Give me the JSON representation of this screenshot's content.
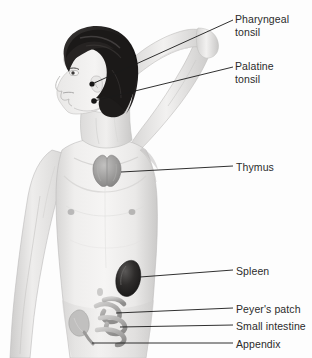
{
  "figure": {
    "view": "anterior-with-head-in-left-profile",
    "pose": "right-arm-raised-hand-behind-head",
    "background_color": "#fdfdfd",
    "line_color": "#1a1a1a",
    "text_color": "#2b2b2b"
  },
  "labels": [
    {
      "id": "pharyngeal",
      "text": "Pharyngeal\ntonsil"
    },
    {
      "id": "palatine",
      "text": "Palatine\ntonsil"
    },
    {
      "id": "thymus",
      "text": "Thymus"
    },
    {
      "id": "spleen",
      "text": "Spleen"
    },
    {
      "id": "peyers_patch",
      "text": "Peyer's patch"
    },
    {
      "id": "small_intestine",
      "text": "Small intestine"
    },
    {
      "id": "appendix",
      "text": "Appendix"
    }
  ],
  "organs": {
    "thymus": {
      "name": "thymus",
      "color": "#9a9a9a",
      "shape": "butterfly-lobed"
    },
    "spleen": {
      "name": "spleen",
      "color": "#2e2e2e",
      "shape": "bean"
    },
    "small_intestine": {
      "name": "small-intestine",
      "color": "#b0b0b0",
      "shape": "coiled-loops"
    },
    "appendix": {
      "name": "appendix",
      "color": "#a8a8a8",
      "shape": "small-pouch"
    },
    "palatine_tonsil": {
      "name": "palatine-tonsil",
      "color": "#1a1a1a",
      "shape": "dot"
    },
    "pharyngeal_tonsil": {
      "name": "pharyngeal-tonsil",
      "color": "#1a1a1a",
      "shape": "dot"
    }
  },
  "body_colors": {
    "skin_light": "#f2f1f0",
    "skin_mid": "#e3e2e1",
    "skin_shadow": "#cfcecd",
    "skin_deep": "#b9b8b7",
    "hair_dark": "#1c1a1a",
    "hair_highlight": "#474444",
    "outline": "#b5b4b3"
  }
}
